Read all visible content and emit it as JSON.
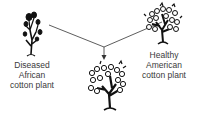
{
  "diagram": {
    "nodes": [
      {
        "id": "left",
        "label_lines": [
          "Diseased",
          "African",
          "cotton plant"
        ],
        "icon": "sparse-plant-icon"
      },
      {
        "id": "right",
        "label_lines": [
          "Healthy",
          "American",
          "cotton plant"
        ],
        "icon": "cotton-plant-icon"
      },
      {
        "id": "bottom",
        "label_lines": [],
        "icon": "cotton-plant-icon"
      }
    ],
    "edges": [
      {
        "from": "left",
        "to": "bottom"
      },
      {
        "from": "right",
        "to": "bottom"
      }
    ],
    "colors": {
      "line": "#333333",
      "plant": "#111111",
      "text": "#3a3a3a"
    }
  }
}
